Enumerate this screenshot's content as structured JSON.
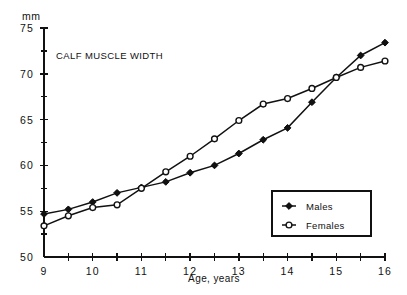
{
  "chart_data": {
    "type": "line",
    "title": "CALF MUSCLE WIDTH",
    "xlabel": "Age, years",
    "ylabel": "mm",
    "unit_label": "mm",
    "xlim": [
      9,
      16
    ],
    "ylim": [
      50,
      75
    ],
    "grid": false,
    "legend_position": "bottom-right",
    "x": [
      9,
      9.5,
      10,
      10.5,
      11,
      11.5,
      12,
      12.5,
      13,
      13.5,
      14,
      14.5,
      15,
      15.5,
      16
    ],
    "xtick_labels": [
      "9",
      "10",
      "11",
      "12",
      "13",
      "14",
      "15",
      "16"
    ],
    "xtick_major": [
      9,
      10,
      11,
      12,
      13,
      14,
      15,
      16
    ],
    "xtick_minor": [
      9.5,
      10.5,
      11.5,
      12.5,
      13.5,
      14.5,
      15.5
    ],
    "ytick_labels": [
      "50",
      "55",
      "60",
      "65",
      "70",
      "75"
    ],
    "ytick_major": [
      50,
      55,
      60,
      65,
      70,
      75
    ],
    "ytick_minor": [
      52.5,
      57.5,
      62.5,
      67.5,
      72.5
    ],
    "series": [
      {
        "name": "Males",
        "marker": "filled-diamond",
        "values": [
          54.7,
          55.2,
          56.0,
          57.0,
          57.6,
          58.2,
          59.2,
          60.0,
          61.3,
          62.8,
          64.1,
          66.9,
          69.6,
          72.0,
          73.4
        ]
      },
      {
        "name": "Females",
        "marker": "open-circle",
        "values": [
          53.4,
          54.5,
          55.4,
          55.7,
          57.5,
          59.3,
          61.0,
          62.9,
          64.9,
          66.7,
          67.3,
          68.4,
          69.6,
          70.7,
          71.4
        ]
      }
    ],
    "legend": [
      {
        "label": "Males",
        "marker": "filled-diamond"
      },
      {
        "label": "Females",
        "marker": "open-circle"
      }
    ],
    "colors": {
      "ink": "#111111",
      "background": "#ffffff"
    }
  }
}
